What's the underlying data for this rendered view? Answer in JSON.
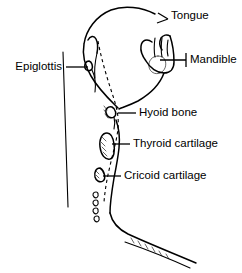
{
  "figure": {
    "background_color": "#ffffff",
    "line_color": "#000000",
    "width": 242,
    "height": 273
  },
  "labels": [
    {
      "id": "tongue",
      "text": "Tongue",
      "text_x": 171,
      "text_y": 16,
      "anchor": "start",
      "leader": "M 168 19 L 158 13 M 168 19 L 157 23"
    },
    {
      "id": "mandible",
      "text": "Mandible",
      "text_x": 190,
      "text_y": 60,
      "anchor": "start",
      "leader": "M 186 60 L 160 60 M 186 53 L 186 67"
    },
    {
      "id": "epiglottis",
      "text": "Epiglottis",
      "text_x": 62,
      "text_y": 67,
      "anchor": "end",
      "leader": "M 66 67 L 88 67"
    },
    {
      "id": "hyoid-bone",
      "text": "Hyoid bone",
      "text_x": 139,
      "text_y": 113,
      "anchor": "start",
      "leader": "M 136 113 L 118 113"
    },
    {
      "id": "thyroid-cartilage",
      "text": "Thyroid cartilage",
      "text_x": 133,
      "text_y": 144,
      "anchor": "start",
      "leader": "M 130 144 L 112 144"
    },
    {
      "id": "cricoid-cartilage",
      "text": "Cricoid cartilage",
      "text_x": 124,
      "text_y": 176,
      "anchor": "start",
      "leader": "M 121 176 L 103 176"
    }
  ],
  "structures": {
    "head_outline": "M 155 14 C 142 7 124 5 111 10 C 96 16 86 30 84 44 C 82 55 85 66 91 76 C 99 90 110 100 118 108",
    "posterior_wall": "M 63 52 L 68 207",
    "soft_palate": "M 88 40 C 90 36 94 35 96 39 C 98 43 98 48 97 53",
    "epiglottis_shape": "M 89 61 C 86 61 84 64 85 68 C 86 71 90 72 92 69 C 93 66 92 62 89 61 Z",
    "epiglottis_stem": "M 92 70 C 95 76 96 84 95 92",
    "pharynx_front": "M 97 53 C 95 62 94 70 95 78",
    "airway_dashed": "M 98 41 C 101 58 107 78 113 96 C 117 108 119 118 118 128 C 117 140 113 152 110 166 C 107 178 105 190 104 202",
    "mandible_body": "M 152 42 C 147 38 142 40 141 46 C 140 52 143 57 146 61 C 150 68 157 73 164 73 C 170 73 174 69 174 62 C 174 52 172 42 170 36",
    "mandible_ramus": "M 170 36 C 167 34 163 35 161 38 C 159 42 160 47 162 50",
    "tooth_one": "M 155 38 C 154 45 154 52 155 57",
    "tooth_two": "M 162 38 C 161 45 161 52 162 57",
    "tooth_three": "M 168 40 C 167 46 167 52 168 56",
    "chin_circle": "M 158 56 C 152 56 148 61 149 67 C 150 72 155 75 160 73 C 165 71 167 65 165 60 C 164 57 161 56 158 56 Z",
    "jaw_to_hyoid": "M 164 73 C 160 84 150 94 138 101 C 130 105 124 107 119 109",
    "hyoid_shape": "M 112 107 C 108 106 105 109 106 113 C 107 117 111 119 114 117 C 117 115 116 109 112 107 Z",
    "hyoid_tail": "M 114 117 C 115 121 115 125 114 129",
    "thyroid_shape": "M 107 133 C 102 133 99 139 100 147 C 101 155 105 160 110 159 C 114 158 115 151 114 144 C 113 137 111 133 107 133 Z",
    "cricoid_shape": "M 100 168 C 96 168 94 172 95 177 C 96 181 100 183 103 181 C 106 179 105 171 100 168 Z",
    "larynx_front": "M 116 120 C 119 128 120 138 119 148 C 118 158 116 168 114 178 C 112 190 110 202 110 213",
    "trachea_rings": [
      "M 96 192 C 93 192 92 195 94 197 C 96 199 99 197 98 194 C 98 193 97 192 96 192 Z",
      "M 96 200 C 93 200 92 203 94 205 C 96 207 99 205 98 202 C 98 201 97 200 96 200 Z",
      "M 96 208 C 93 208 92 211 94 213 C 96 215 99 213 98 210 C 98 209 97 208 96 208 Z",
      "M 97 216 C 94 216 93 219 95 221 C 97 223 100 221 99 218 C 99 217 98 216 97 216 Z"
    ],
    "chest_outline": "M 110 213 C 112 222 118 229 128 234 C 145 242 170 252 196 263",
    "sternum_lower": "M 125 242 C 145 249 168 258 190 268",
    "sternum_hatch": [
      "M 131 238 L 134 243",
      "M 138 241 L 141 246",
      "M 145 244 L 148 249",
      "M 152 247 L 155 252",
      "M 159 251 L 162 256",
      "M 166 254 L 169 259"
    ],
    "hyoid_hatch": [
      "M 104 106 L 107 110",
      "M 104 110 L 107 114",
      "M 105 114 L 108 118"
    ],
    "thyroid_hatch": [
      "M 102 137 L 106 141",
      "M 101 142 L 105 146",
      "M 102 147 L 106 151",
      "M 103 152 L 107 156"
    ],
    "cricoid_hatch": [
      "M 96 171 L 99 174",
      "M 96 175 L 99 178"
    ]
  }
}
